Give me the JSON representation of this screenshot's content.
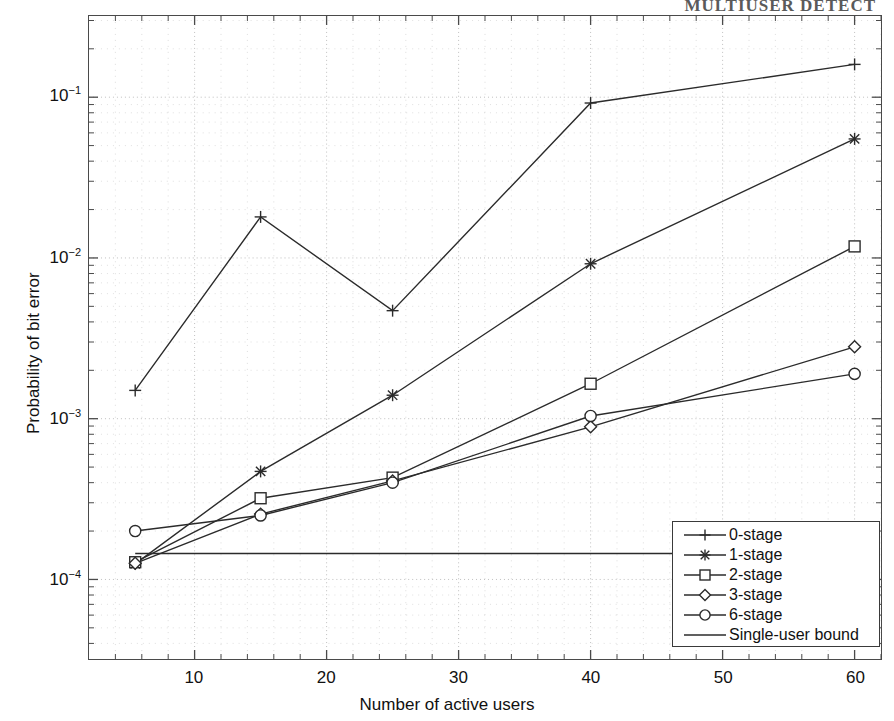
{
  "running_head": "MULTIUSER DETECT",
  "chart_data": {
    "type": "line",
    "title": "",
    "xlabel": "Number of active users",
    "ylabel": "Probability of bit error",
    "xlim": [
      2,
      62
    ],
    "ylim": [
      3.2e-05,
      0.32
    ],
    "yscale": "log",
    "xscale": "linear",
    "grid": true,
    "grid_style": "dotted",
    "legend_position": "lower right",
    "xticks": [
      10,
      20,
      30,
      40,
      50,
      60
    ],
    "xtick_labels": [
      "10",
      "20",
      "30",
      "40",
      "50",
      "60"
    ],
    "yticks": [
      0.1,
      0.01,
      0.001,
      0.0001
    ],
    "ytick_labels": [
      "10-1",
      "10-2",
      "10-3",
      "10-4"
    ],
    "ytick_mantissa": [
      "10",
      "10",
      "10",
      "10"
    ],
    "ytick_exponent": [
      "-1",
      "-2",
      "-3",
      "-4"
    ],
    "x": [
      5.5,
      15,
      25,
      40,
      60
    ],
    "series": [
      {
        "name": "0-stage",
        "marker": "plus",
        "values": [
          0.0015,
          0.018,
          0.0047,
          0.092,
          0.16
        ]
      },
      {
        "name": "1-stage",
        "marker": "asterisk",
        "values": [
          0.000125,
          0.00047,
          0.0014,
          0.0092,
          0.055
        ]
      },
      {
        "name": "2-stage",
        "marker": "square",
        "values": [
          0.000128,
          0.00032,
          0.00043,
          0.00165,
          0.0118
        ]
      },
      {
        "name": "3-stage",
        "marker": "diamond",
        "values": [
          0.000126,
          0.000255,
          0.00041,
          0.00089,
          0.0028
        ]
      },
      {
        "name": "6-stage",
        "marker": "circle",
        "values": [
          0.0002,
          0.00025,
          0.0004,
          0.00104,
          0.0019
        ]
      },
      {
        "name": "Single-user bound",
        "marker": "none",
        "values": [
          0.000145,
          0.000145,
          0.000145,
          0.000145,
          0.000145
        ]
      }
    ]
  },
  "legend": {
    "items": [
      {
        "label": "0-stage",
        "marker": "plus"
      },
      {
        "label": "1-stage",
        "marker": "asterisk"
      },
      {
        "label": "2-stage",
        "marker": "square"
      },
      {
        "label": "3-stage",
        "marker": "diamond"
      },
      {
        "label": "6-stage",
        "marker": "circle"
      },
      {
        "label": "Single-user bound",
        "marker": "none"
      }
    ]
  },
  "colors": {
    "line": "#2b2b2b",
    "axis": "#4a4a4a",
    "grid": "#bdbdbd",
    "text": "#111111"
  }
}
